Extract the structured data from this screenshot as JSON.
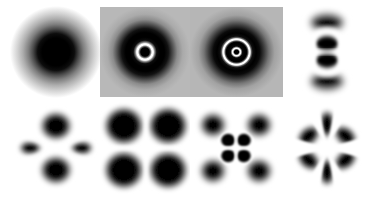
{
  "figure": {
    "background_color": "#ffffff",
    "density_color": "#000000",
    "node_color": "#ffffff",
    "halo_color": "#a8a8a8",
    "grid": {
      "columns": 4,
      "rows": 2
    },
    "width": 371,
    "height": 197
  },
  "panels": [
    {
      "index": 1,
      "name": "1s",
      "label": "1s",
      "row": 1,
      "column": 1,
      "type": "radial",
      "radial_nodes": 0,
      "angular_nodes": 0,
      "lobes": 1,
      "background": "#ffffff",
      "x": 10,
      "y": 6,
      "width": 92,
      "height": 92,
      "core_radius": 0.3,
      "falloff": 0.62
    },
    {
      "index": 2,
      "name": "2s",
      "label": "2s",
      "row": 1,
      "column": 2,
      "type": "radial",
      "radial_nodes": 1,
      "angular_nodes": 0,
      "lobes": 1,
      "background": "#b4b4b4",
      "x": 100,
      "y": 7,
      "width": 90,
      "height": 90,
      "core_radius": 0.115,
      "node_radii": [
        0.175
      ],
      "falloff": 0.52
    },
    {
      "index": 3,
      "name": "3s",
      "label": "3s",
      "row": 1,
      "column": 3,
      "type": "radial",
      "radial_nodes": 2,
      "angular_nodes": 0,
      "lobes": 1,
      "background": "#b4b4b4",
      "x": 190,
      "y": 7,
      "width": 93,
      "height": 90,
      "core_radius": 0.055,
      "node_radii": [
        0.085,
        0.275
      ],
      "falloff": 0.6
    },
    {
      "index": 4,
      "name": "3pz",
      "label": "3p",
      "row": 1,
      "column": 4,
      "type": "angular",
      "radial_nodes": 1,
      "angular_nodes": 1,
      "lobes": 2,
      "orientation": "vertical",
      "background": "#ffffff",
      "x": 286,
      "y": 6,
      "width": 82,
      "height": 92,
      "inner_radius": 0.22,
      "node_radii": [
        0.27
      ],
      "outer_radius": 0.52
    },
    {
      "index": 5,
      "name": "3d-two-lobe",
      "label": "3d",
      "row": 2,
      "column": 1,
      "type": "angular",
      "radial_nodes": 0,
      "angular_nodes": 2,
      "lobes": 4,
      "orientation": "vertical-dominant",
      "background": "#ffffff",
      "x": 10,
      "y": 104,
      "width": 92,
      "height": 88,
      "major_lobe_extent": 0.46,
      "minor_lobe_extent": 0.3
    },
    {
      "index": 6,
      "name": "3d-clover",
      "label": "3d",
      "row": 2,
      "column": 2,
      "type": "angular",
      "radial_nodes": 0,
      "angular_nodes": 2,
      "lobes": 4,
      "orientation": "diagonal",
      "background": "#ffffff",
      "x": 100,
      "y": 102,
      "width": 92,
      "height": 92,
      "major_lobe_extent": 0.62,
      "minor_lobe_extent": 0.62
    },
    {
      "index": 7,
      "name": "4d-clover",
      "label": "4d",
      "row": 2,
      "column": 3,
      "type": "angular",
      "radial_nodes": 1,
      "angular_nodes": 2,
      "lobes": 4,
      "orientation": "diagonal",
      "background": "#ffffff",
      "x": 190,
      "y": 102,
      "width": 92,
      "height": 92,
      "inner_radius": 0.18,
      "node_radii": [
        0.215
      ],
      "outer_radius": 0.5
    },
    {
      "index": 8,
      "name": "4f-six-lobe",
      "label": "4f",
      "row": 2,
      "column": 4,
      "type": "angular",
      "radial_nodes": 0,
      "angular_nodes": 3,
      "lobes": 6,
      "orientation": "radial-flower",
      "background": "#ffffff",
      "x": 286,
      "y": 102,
      "width": 82,
      "height": 92,
      "major_lobe_extent": 0.46,
      "minor_lobe_extent": 0.46
    }
  ]
}
